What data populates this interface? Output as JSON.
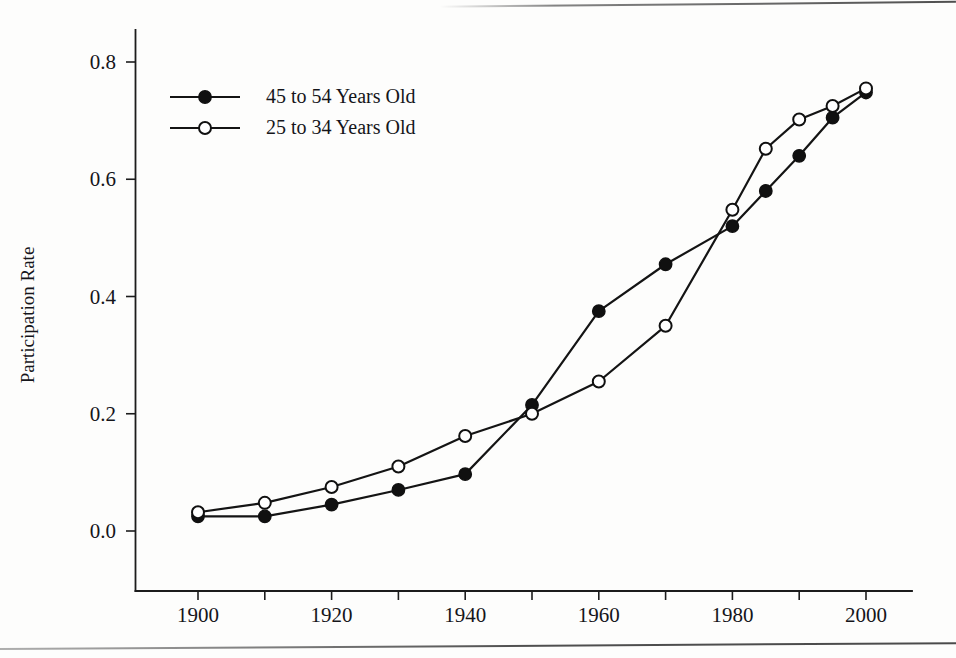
{
  "chart_data": {
    "type": "line",
    "title": "",
    "xlabel": "",
    "ylabel": "Participation Rate",
    "xlim": [
      1895,
      2005
    ],
    "ylim": [
      0.0,
      0.85
    ],
    "grid": false,
    "legend_position": "top-left",
    "x_tick_labels": [
      "1900",
      "1920",
      "1940",
      "1960",
      "1980",
      "2000"
    ],
    "x_tick_values": [
      1900,
      1920,
      1940,
      1960,
      1980,
      2000
    ],
    "x_minor_tick_values": [
      1910,
      1930,
      1950,
      1970,
      1990
    ],
    "y_tick_labels": [
      "0.0",
      "0.2",
      "0.4",
      "0.6",
      "0.8"
    ],
    "y_tick_values": [
      0.0,
      0.2,
      0.4,
      0.6,
      0.8
    ],
    "x": [
      1900,
      1910,
      1920,
      1930,
      1940,
      1950,
      1960,
      1970,
      1980,
      1985,
      1990,
      1995,
      2000
    ],
    "series": [
      {
        "name": "45 to 54 Years Old",
        "marker": "filled-circle",
        "color": "#101010",
        "values": [
          0.025,
          0.025,
          0.045,
          0.07,
          0.097,
          0.215,
          0.375,
          0.455,
          0.52,
          0.58,
          0.64,
          0.705,
          0.748
        ]
      },
      {
        "name": "25 to 34 Years Old",
        "marker": "open-circle",
        "color": "#101010",
        "values": [
          0.032,
          0.048,
          0.075,
          0.11,
          0.162,
          0.2,
          0.255,
          0.35,
          0.548,
          0.652,
          0.702,
          0.725,
          0.755
        ]
      }
    ]
  },
  "legend": {
    "entries": [
      {
        "label": "45 to 54 Years Old",
        "marker": "filled-circle"
      },
      {
        "label": "25 to 34 Years Old",
        "marker": "open-circle"
      }
    ]
  },
  "axes": {
    "y_title": "Participation Rate"
  }
}
